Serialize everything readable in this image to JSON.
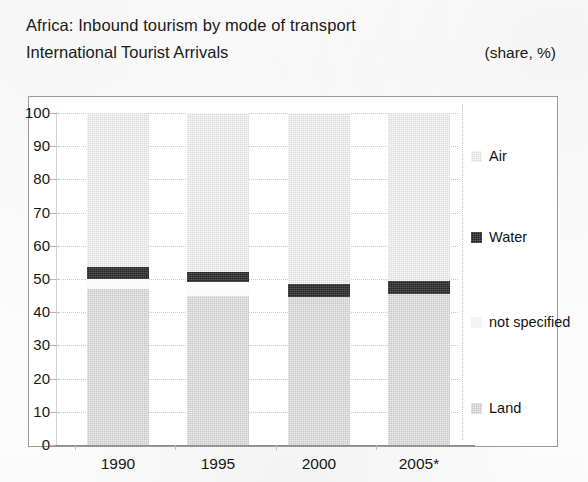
{
  "header": {
    "title_line1": "Africa: Inbound tourism by mode of transport",
    "title_line2": "International Tourist Arrivals",
    "unit_note": "(share, %)"
  },
  "legend": {
    "items": [
      {
        "label": "Air",
        "swatch": "air-swatch",
        "color": "#dcdcdc"
      },
      {
        "label": "Water",
        "swatch": "water-swatch",
        "color": "#1f1f1f"
      },
      {
        "label": "not specified",
        "swatch": "not-specified-swatch",
        "color": "#f4f4f4"
      },
      {
        "label": "Land",
        "swatch": "land-swatch",
        "color": "#c4c4c4"
      }
    ]
  },
  "axis": {
    "y_ticks": [
      "100",
      "90",
      "80",
      "70",
      "60",
      "50",
      "40",
      "30",
      "20",
      "10",
      "0"
    ],
    "x_ticks": [
      "1990",
      "1995",
      "2000",
      "2005*"
    ]
  },
  "chart_data": {
    "type": "bar",
    "subtype": "stacked-vertical-100-percent",
    "title": "Africa: Inbound tourism by mode of transport",
    "subtitle": "International Tourist Arrivals",
    "xlabel": "",
    "ylabel": "",
    "unit": "share, %",
    "ylim": [
      0,
      100
    ],
    "yticks": [
      0,
      10,
      20,
      30,
      40,
      50,
      60,
      70,
      80,
      90,
      100
    ],
    "grid": true,
    "legend_position": "right",
    "categories": [
      "1990",
      "1995",
      "2000",
      "2005*"
    ],
    "stack_order_bottom_to_top": [
      "Land",
      "not specified",
      "Water",
      "Air"
    ],
    "series": [
      {
        "name": "Land",
        "color": "#c4c4c4",
        "values": [
          47.0,
          45.0,
          44.5,
          45.5
        ]
      },
      {
        "name": "not specified",
        "color": "#f4f4f4",
        "values": [
          3.0,
          4.0,
          0.0,
          0.0
        ]
      },
      {
        "name": "Water",
        "color": "#1f1f1f",
        "values": [
          3.5,
          3.0,
          4.0,
          4.0
        ]
      },
      {
        "name": "Air",
        "color": "#dcdcdc",
        "values": [
          46.5,
          48.0,
          51.5,
          50.5
        ]
      }
    ]
  }
}
